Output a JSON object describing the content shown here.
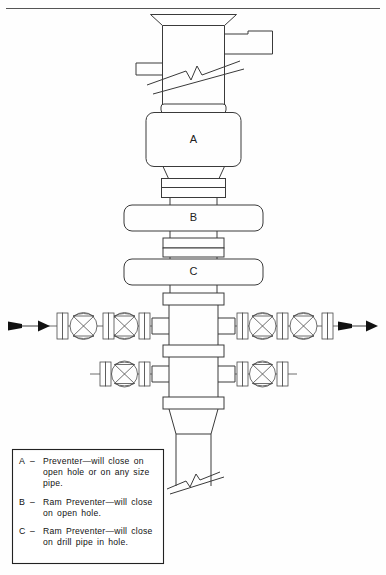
{
  "page": {
    "background_color": "#fefefe",
    "line_color": "#3a3a3a",
    "header_rule": true
  },
  "diagram": {
    "name": "bop-stack",
    "components": [
      {
        "id": "bell-nipple",
        "label": "",
        "kind": "bell-nipple"
      },
      {
        "id": "flow-line-outlet-right",
        "label": "",
        "kind": "side-outlet"
      },
      {
        "id": "fill-line-outlet-left",
        "label": "",
        "kind": "side-outlet"
      },
      {
        "id": "riser-break",
        "label": "",
        "kind": "break-symbol"
      },
      {
        "id": "annular-preventer",
        "label": "A",
        "kind": "annular-preventer"
      },
      {
        "id": "spool-a-b",
        "label": "",
        "kind": "flange-spool"
      },
      {
        "id": "ram-preventer-upper",
        "label": "B",
        "kind": "ram-preventer"
      },
      {
        "id": "spool-b-c",
        "label": "",
        "kind": "flange-spool"
      },
      {
        "id": "ram-preventer-lower",
        "label": "C",
        "kind": "ram-preventer"
      },
      {
        "id": "drilling-spool-upper",
        "label": "",
        "kind": "drilling-spool"
      },
      {
        "id": "drilling-spool-lower",
        "label": "",
        "kind": "drilling-spool"
      },
      {
        "id": "casing-head",
        "label": "",
        "kind": "casing-head"
      },
      {
        "id": "casing-break",
        "label": "",
        "kind": "break-symbol"
      }
    ],
    "valves": {
      "symbol": "gate-valve-bowtie",
      "upper_left_count": 2,
      "upper_right_count": 2,
      "lower_left_count": 1,
      "lower_right_count": 1
    },
    "flow_arrows": {
      "left": {
        "direction": "right",
        "style": "solid-wedge"
      },
      "right": {
        "direction": "right",
        "style": "solid-wedge"
      }
    },
    "labels": {
      "annular": "A",
      "ram_upper": "B",
      "ram_lower": "C"
    }
  },
  "legend": {
    "entries": [
      {
        "key": "A",
        "dash": "–",
        "text": "Preventer—will close on open hole or on any size pipe."
      },
      {
        "key": "B",
        "dash": "–",
        "text": "Ram Preventer—will close on open hole."
      },
      {
        "key": "C",
        "dash": "–",
        "text": "Ram Preventer—will close on drill pipe in hole."
      }
    ]
  }
}
